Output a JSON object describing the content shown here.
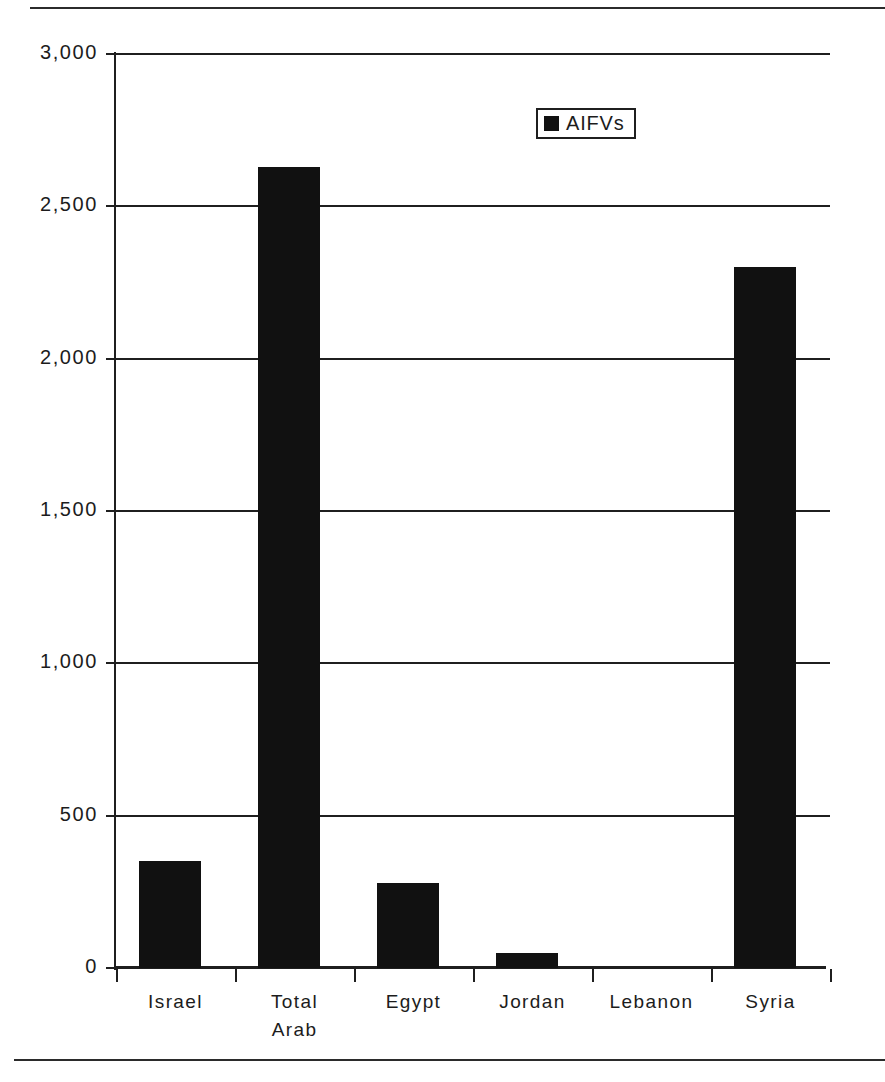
{
  "chart_data": {
    "type": "bar",
    "title": "",
    "subtitle": "",
    "xlabel": "",
    "ylabel": "",
    "categories": [
      "Israel",
      "Total\nArab",
      "Egypt",
      "Jordan",
      "Lebanon",
      "Syria"
    ],
    "values": [
      350,
      2630,
      280,
      50,
      0,
      2300
    ],
    "series": [
      {
        "name": "AIFVs",
        "values": [
          350,
          2630,
          280,
          50,
          0,
          2300
        ],
        "color": "#111111"
      }
    ],
    "ylim": [
      0,
      3000
    ],
    "ytick_values": [
      0,
      500,
      1000,
      1500,
      2000,
      2500,
      3000
    ],
    "ytick_labels": [
      "0",
      "500",
      "1,000",
      "1,500",
      "2,000",
      "2,500",
      "3,000"
    ],
    "grid": true,
    "grid_axis": "y",
    "legend": {
      "position": "top-right-inside",
      "entries": [
        {
          "label": "AIFVs",
          "swatch_color": "#111111"
        }
      ]
    },
    "axis_color": "#1f1f1f",
    "background_color": "#ffffff"
  },
  "page": {
    "rule_color": "#2b2b2b"
  }
}
